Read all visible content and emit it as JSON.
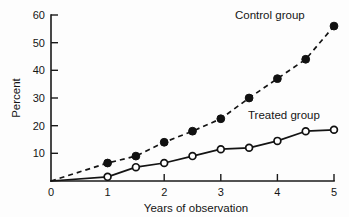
{
  "chart_data": {
    "type": "line",
    "title": "",
    "xlabel": "Years of observation",
    "ylabel": "Percent",
    "xlim": [
      0,
      5
    ],
    "ylim": [
      0,
      60
    ],
    "grid": false,
    "legend_position": "inline-annotation",
    "x": [
      0,
      1,
      1.5,
      2,
      2.5,
      3,
      3.5,
      4,
      4.5,
      5
    ],
    "xticks": [
      "0",
      "1",
      "2",
      "3",
      "4",
      "5"
    ],
    "xtick_values": [
      0,
      1,
      2,
      3,
      4,
      5
    ],
    "yticks": [
      "10",
      "20",
      "30",
      "40",
      "50",
      "60"
    ],
    "ytick_values": [
      10,
      20,
      30,
      40,
      50,
      60
    ],
    "series": [
      {
        "name": "Control group",
        "label": "Control group",
        "style": "dashed",
        "marker": "filled-circle",
        "color": "#111111",
        "x": [
          0,
          1,
          1.5,
          2,
          2.5,
          3,
          3.5,
          4,
          4.5,
          5
        ],
        "values": [
          0,
          6.5,
          9,
          14,
          18,
          22.5,
          30,
          37,
          44,
          56
        ]
      },
      {
        "name": "Treated group",
        "label": "Treated group",
        "style": "solid",
        "marker": "open-circle",
        "color": "#111111",
        "x": [
          0,
          1,
          1.5,
          2,
          2.5,
          3,
          3.5,
          4,
          4.5,
          5
        ],
        "values": [
          0,
          1.5,
          5,
          6.5,
          9,
          11.5,
          12,
          14.5,
          18,
          18.5
        ]
      }
    ],
    "annotations": [
      {
        "text": "Control group",
        "x": 3.6,
        "y": 57
      },
      {
        "text": "Treated group",
        "x": 3.55,
        "y": 24
      }
    ]
  },
  "axes": {
    "y_axis_label": "Percent",
    "x_axis_label": "Years of observation",
    "origin_label": "0"
  }
}
